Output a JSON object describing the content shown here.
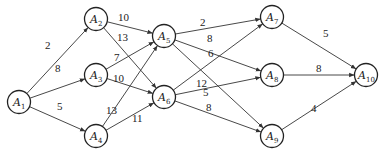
{
  "graph": {
    "type": "directed-weighted-network",
    "nodes": [
      {
        "id": "A1",
        "label": "A",
        "sub": "1",
        "x": 19,
        "y": 102
      },
      {
        "id": "A2",
        "label": "A",
        "sub": "2",
        "x": 96,
        "y": 19
      },
      {
        "id": "A3",
        "label": "A",
        "sub": "3",
        "x": 96,
        "y": 75
      },
      {
        "id": "A4",
        "label": "A",
        "sub": "4",
        "x": 96,
        "y": 136
      },
      {
        "id": "A5",
        "label": "A",
        "sub": "5",
        "x": 164,
        "y": 36
      },
      {
        "id": "A6",
        "label": "A",
        "sub": "6",
        "x": 164,
        "y": 97
      },
      {
        "id": "A7",
        "label": "A",
        "sub": "7",
        "x": 272,
        "y": 17
      },
      {
        "id": "A8",
        "label": "A",
        "sub": "8",
        "x": 272,
        "y": 75
      },
      {
        "id": "A9",
        "label": "A",
        "sub": "9",
        "x": 272,
        "y": 136
      },
      {
        "id": "A10",
        "label": "A",
        "sub": "10",
        "x": 366,
        "y": 75
      }
    ],
    "edges": [
      {
        "from": "A1",
        "to": "A2",
        "weight": "2",
        "lx": 45,
        "ly": 49
      },
      {
        "from": "A1",
        "to": "A3",
        "weight": "8",
        "lx": 55,
        "ly": 72
      },
      {
        "from": "A1",
        "to": "A4",
        "weight": "5",
        "lx": 57,
        "ly": 110
      },
      {
        "from": "A2",
        "to": "A5",
        "weight": "10",
        "lx": 118,
        "ly": 21
      },
      {
        "from": "A2",
        "to": "A6",
        "weight": "13",
        "lx": 117,
        "ly": 41
      },
      {
        "from": "A3",
        "to": "A5",
        "weight": "7",
        "lx": 114,
        "ly": 61
      },
      {
        "from": "A3",
        "to": "A6",
        "weight": "10",
        "lx": 113,
        "ly": 82
      },
      {
        "from": "A4",
        "to": "A5",
        "weight": "13",
        "lx": 106,
        "ly": 114
      },
      {
        "from": "A4",
        "to": "A6",
        "weight": "11",
        "lx": 132,
        "ly": 122
      },
      {
        "from": "A5",
        "to": "A7",
        "weight": "2",
        "lx": 200,
        "ly": 26
      },
      {
        "from": "A5",
        "to": "A8",
        "weight": "8",
        "lx": 207,
        "ly": 42
      },
      {
        "from": "A5",
        "to": "A9",
        "weight": "6",
        "lx": 208,
        "ly": 57
      },
      {
        "from": "A6",
        "to": "A7",
        "weight": "12",
        "lx": 196,
        "ly": 87
      },
      {
        "from": "A6",
        "to": "A8",
        "weight": "5",
        "lx": 203,
        "ly": 96
      },
      {
        "from": "A6",
        "to": "A9",
        "weight": "8",
        "lx": 206,
        "ly": 111
      },
      {
        "from": "A7",
        "to": "A10",
        "weight": "5",
        "lx": 323,
        "ly": 37
      },
      {
        "from": "A8",
        "to": "A10",
        "weight": "8",
        "lx": 316,
        "ly": 72
      },
      {
        "from": "A9",
        "to": "A10",
        "weight": "4",
        "lx": 311,
        "ly": 112
      }
    ]
  }
}
